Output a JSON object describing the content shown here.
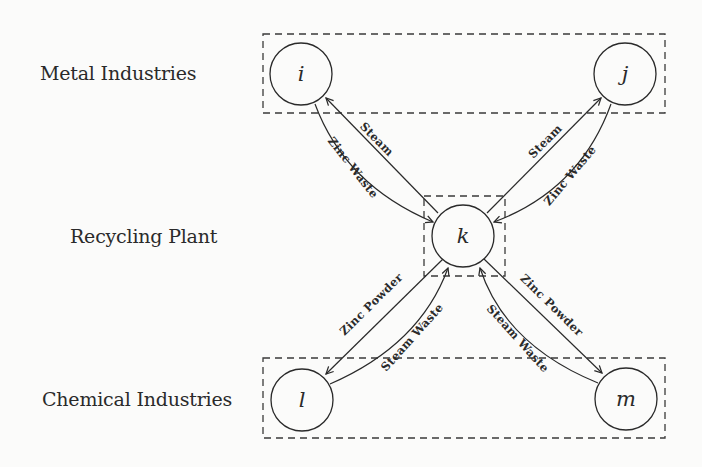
{
  "diagram": {
    "type": "flow-network",
    "groups": [
      {
        "id": "metal",
        "label": "Metal Industries",
        "nodes": [
          "i",
          "j"
        ]
      },
      {
        "id": "recycling",
        "label": "Recycling Plant",
        "nodes": [
          "k"
        ]
      },
      {
        "id": "chemical",
        "label": "Chemical Industries",
        "nodes": [
          "l",
          "m"
        ]
      }
    ],
    "nodes": {
      "i": {
        "label": "i"
      },
      "j": {
        "label": "j"
      },
      "k": {
        "label": "k"
      },
      "l": {
        "label": "l"
      },
      "m": {
        "label": "m"
      }
    },
    "edges": [
      {
        "from": "k",
        "to": "i",
        "label": "Steam"
      },
      {
        "from": "i",
        "to": "k",
        "label": "Zinc Waste"
      },
      {
        "from": "k",
        "to": "j",
        "label": "Steam"
      },
      {
        "from": "j",
        "to": "k",
        "label": "Zinc Waste"
      },
      {
        "from": "k",
        "to": "l",
        "label": "Zinc Powder"
      },
      {
        "from": "l",
        "to": "k",
        "label": "Steam Waste"
      },
      {
        "from": "k",
        "to": "m",
        "label": "Zinc Powder"
      },
      {
        "from": "m",
        "to": "k",
        "label": "Steam Waste"
      }
    ]
  }
}
